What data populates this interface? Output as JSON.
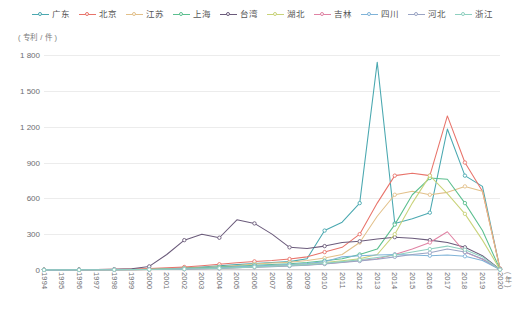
{
  "legend": {
    "items": [
      {
        "label": "广东",
        "color": "#4aa8b0"
      },
      {
        "label": "北京",
        "color": "#e8736a"
      },
      {
        "label": "江苏",
        "color": "#e2c08a"
      },
      {
        "label": "上海",
        "color": "#5bbf8f"
      },
      {
        "label": "台湾",
        "color": "#6b5b7b"
      },
      {
        "label": "湖北",
        "color": "#c9d37a"
      },
      {
        "label": "吉林",
        "color": "#e083a4"
      },
      {
        "label": "四川",
        "color": "#7fb3d8"
      },
      {
        "label": "河北",
        "color": "#9aa4c4"
      },
      {
        "label": "浙江",
        "color": "#8fd0c0"
      }
    ]
  },
  "axes": {
    "y_unit": "( 专利 / 件 )",
    "y_ticks": [
      "1 800",
      "1 500",
      "1 200",
      "900",
      "600",
      "300",
      "0"
    ],
    "x_title": "( 年 )"
  },
  "chart_data": {
    "type": "line",
    "title": "",
    "xlabel": "( 年 )",
    "ylabel": "( 专利 / 件 )",
    "ylim": [
      0,
      1800
    ],
    "ytick_values": [
      0,
      300,
      600,
      900,
      1200,
      1500,
      1800
    ],
    "grid": true,
    "legend_position": "top",
    "categories": [
      "1994",
      "1995",
      "1996",
      "1997",
      "1998",
      "1999",
      "2000",
      "2001",
      "2002",
      "2003",
      "2004",
      "2005",
      "2006",
      "2007",
      "2008",
      "2009",
      "2010",
      "2011",
      "2012",
      "2013",
      "2014",
      "2015",
      "2016",
      "2017",
      "2018",
      "2019",
      "2020"
    ],
    "series": [
      {
        "name": "广东",
        "color": "#4aa8b0",
        "values": [
          2,
          2,
          3,
          3,
          4,
          5,
          8,
          12,
          18,
          25,
          35,
          45,
          55,
          62,
          70,
          95,
          330,
          400,
          560,
          1740,
          390,
          430,
          480,
          1180,
          790,
          700,
          10
        ]
      },
      {
        "name": "北京",
        "color": "#e8736a",
        "values": [
          3,
          3,
          4,
          5,
          6,
          8,
          12,
          18,
          25,
          35,
          48,
          60,
          72,
          80,
          92,
          110,
          150,
          190,
          300,
          560,
          790,
          810,
          790,
          1290,
          900,
          660,
          12
        ]
      },
      {
        "name": "江苏",
        "color": "#e2c08a",
        "values": [
          1,
          1,
          2,
          2,
          3,
          4,
          6,
          9,
          14,
          20,
          28,
          38,
          50,
          58,
          65,
          80,
          100,
          130,
          230,
          450,
          630,
          660,
          630,
          650,
          700,
          660,
          8
        ]
      },
      {
        "name": "上海",
        "color": "#5bbf8f",
        "values": [
          1,
          1,
          2,
          2,
          3,
          4,
          5,
          8,
          12,
          18,
          25,
          32,
          40,
          46,
          52,
          62,
          78,
          95,
          130,
          175,
          380,
          630,
          770,
          760,
          560,
          330,
          6
        ]
      },
      {
        "name": "台湾",
        "color": "#6b5b7b",
        "values": [
          2,
          2,
          3,
          4,
          6,
          10,
          30,
          130,
          250,
          300,
          270,
          420,
          390,
          300,
          190,
          180,
          200,
          230,
          240,
          260,
          275,
          265,
          250,
          230,
          190,
          120,
          5
        ]
      },
      {
        "name": "湖北",
        "color": "#c9d37a",
        "values": [
          1,
          1,
          1,
          2,
          2,
          3,
          4,
          6,
          9,
          13,
          18,
          24,
          30,
          36,
          42,
          50,
          62,
          78,
          95,
          130,
          300,
          560,
          790,
          640,
          470,
          250,
          5
        ]
      },
      {
        "name": "吉林",
        "color": "#e083a4",
        "values": [
          1,
          1,
          1,
          2,
          2,
          3,
          4,
          5,
          7,
          10,
          14,
          19,
          25,
          30,
          35,
          42,
          52,
          65,
          80,
          95,
          130,
          175,
          230,
          320,
          150,
          90,
          4
        ]
      },
      {
        "name": "四川",
        "color": "#7fb3d8",
        "values": [
          1,
          1,
          2,
          2,
          3,
          4,
          5,
          7,
          10,
          14,
          19,
          26,
          34,
          40,
          46,
          55,
          70,
          110,
          120,
          125,
          130,
          125,
          120,
          125,
          115,
          80,
          4
        ]
      },
      {
        "name": "河北",
        "color": "#9aa4c4",
        "values": [
          1,
          1,
          1,
          2,
          2,
          3,
          4,
          5,
          7,
          10,
          13,
          18,
          23,
          28,
          33,
          40,
          50,
          62,
          75,
          90,
          110,
          130,
          145,
          175,
          150,
          95,
          3
        ]
      },
      {
        "name": "浙江",
        "color": "#8fd0c0",
        "values": [
          1,
          1,
          1,
          2,
          2,
          3,
          4,
          6,
          8,
          11,
          15,
          20,
          26,
          31,
          37,
          45,
          56,
          70,
          85,
          105,
          125,
          150,
          175,
          200,
          170,
          110,
          3
        ]
      }
    ]
  }
}
